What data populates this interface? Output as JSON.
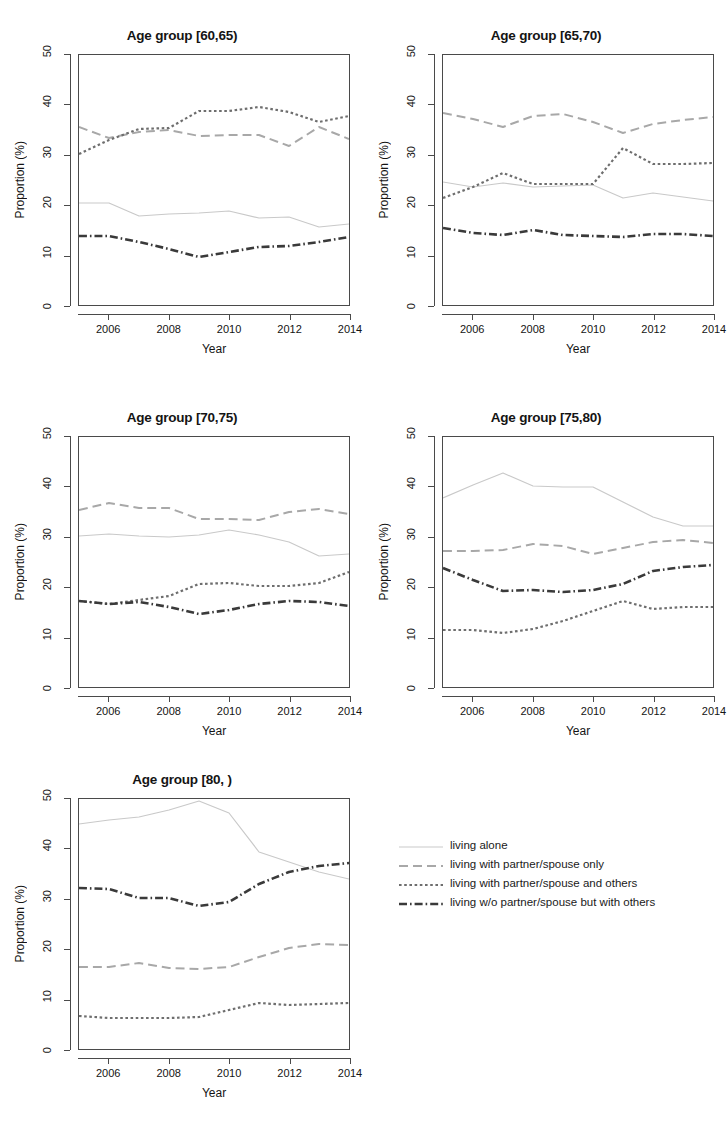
{
  "figure": {
    "axis_titles": {
      "x": "Year",
      "y": "Proportion (%)"
    },
    "y_ticks": [
      "0",
      "10",
      "20",
      "30",
      "40",
      "50"
    ],
    "x_ticks": [
      "2006",
      "2008",
      "2010",
      "2012",
      "2014"
    ]
  },
  "legend": {
    "entries": [
      {
        "label": "living alone",
        "style": "solid",
        "color": "#c9c9c9"
      },
      {
        "label": "living with partner/spouse only",
        "style": "longdash",
        "color": "#a8a8a8"
      },
      {
        "label": "living with partner/spouse and others",
        "style": "dotted",
        "color": "#6e6e6e"
      },
      {
        "label": "living w/o partner/spouse but with others",
        "style": "dashdot",
        "color": "#3a3a3a"
      }
    ]
  },
  "chart_data": [
    {
      "type": "line",
      "title": "Age group [60,65)",
      "xlabel": "Year",
      "ylabel": "Proportion (%)",
      "x": [
        2005,
        2006,
        2007,
        2008,
        2009,
        2010,
        2011,
        2012,
        2013,
        2014
      ],
      "xlim": [
        2005,
        2014
      ],
      "ylim": [
        0,
        50
      ],
      "grid": false,
      "series": [
        {
          "name": "living alone",
          "style": "solid",
          "color": "#c9c9c9",
          "values": [
            20.4,
            20.4,
            17.8,
            18.2,
            18.4,
            18.8,
            17.4,
            17.6,
            15.6,
            16.2
          ]
        },
        {
          "name": "living with partner/spouse only",
          "style": "longdash",
          "color": "#a8a8a8",
          "values": [
            35.6,
            33.4,
            34.6,
            35.0,
            33.8,
            34.0,
            34.0,
            31.8,
            35.6,
            33.2
          ]
        },
        {
          "name": "living with partner/spouse and others",
          "style": "dotted",
          "color": "#6e6e6e",
          "values": [
            30.2,
            33.0,
            35.2,
            35.4,
            38.8,
            38.8,
            39.6,
            38.6,
            36.6,
            37.8
          ]
        },
        {
          "name": "living w/o partner/spouse but with others",
          "style": "dashdot",
          "color": "#3a3a3a",
          "values": [
            13.8,
            13.8,
            12.6,
            11.2,
            9.6,
            10.6,
            11.6,
            11.8,
            12.6,
            13.6
          ]
        }
      ]
    },
    {
      "type": "line",
      "title": "Age group [65,70)",
      "xlabel": "Year",
      "ylabel": "Proportion (%)",
      "x": [
        2005,
        2006,
        2007,
        2008,
        2009,
        2010,
        2011,
        2012,
        2013,
        2014
      ],
      "xlim": [
        2005,
        2014
      ],
      "ylim": [
        0,
        50
      ],
      "grid": false,
      "series": [
        {
          "name": "living alone",
          "style": "solid",
          "color": "#c9c9c9",
          "values": [
            24.6,
            23.6,
            24.4,
            23.6,
            23.8,
            24.0,
            21.4,
            22.4,
            21.6,
            20.8
          ]
        },
        {
          "name": "living with partner/spouse only",
          "style": "longdash",
          "color": "#a8a8a8",
          "values": [
            38.4,
            37.2,
            35.6,
            37.8,
            38.2,
            36.6,
            34.4,
            36.2,
            37.0,
            37.6
          ]
        },
        {
          "name": "living with partner/spouse and others",
          "style": "dotted",
          "color": "#6e6e6e",
          "values": [
            21.4,
            23.6,
            26.4,
            24.2,
            24.2,
            24.2,
            31.4,
            28.2,
            28.2,
            28.4
          ]
        },
        {
          "name": "living w/o partner/spouse but with others",
          "style": "dashdot",
          "color": "#3a3a3a",
          "values": [
            15.4,
            14.4,
            14.0,
            15.0,
            14.0,
            13.8,
            13.6,
            14.2,
            14.2,
            13.8
          ]
        }
      ]
    },
    {
      "type": "line",
      "title": "Age group [70,75)",
      "xlabel": "Year",
      "ylabel": "Proportion (%)",
      "x": [
        2005,
        2006,
        2007,
        2008,
        2009,
        2010,
        2011,
        2012,
        2013,
        2014
      ],
      "xlim": [
        2005,
        2014
      ],
      "ylim": [
        0,
        50
      ],
      "grid": false,
      "series": [
        {
          "name": "living alone",
          "style": "solid",
          "color": "#c9c9c9",
          "values": [
            30.2,
            30.6,
            30.2,
            30.0,
            30.4,
            31.4,
            30.4,
            29.0,
            26.2,
            26.6
          ]
        },
        {
          "name": "living with partner/spouse only",
          "style": "longdash",
          "color": "#a8a8a8",
          "values": [
            35.4,
            36.8,
            35.8,
            35.8,
            33.6,
            33.6,
            33.4,
            35.0,
            35.6,
            34.6
          ]
        },
        {
          "name": "living with partner/spouse and others",
          "style": "dotted",
          "color": "#6e6e6e",
          "values": [
            17.2,
            16.6,
            17.4,
            18.2,
            20.6,
            20.8,
            20.2,
            20.2,
            20.8,
            23.0
          ]
        },
        {
          "name": "living w/o partner/spouse but with others",
          "style": "dashdot",
          "color": "#3a3a3a",
          "values": [
            17.2,
            16.6,
            17.0,
            16.0,
            14.6,
            15.4,
            16.6,
            17.2,
            17.0,
            16.2
          ]
        }
      ]
    },
    {
      "type": "line",
      "title": "Age group [75,80)",
      "xlabel": "Year",
      "ylabel": "Proportion (%)",
      "x": [
        2005,
        2006,
        2007,
        2008,
        2009,
        2010,
        2011,
        2012,
        2013,
        2014
      ],
      "xlim": [
        2005,
        2014
      ],
      "ylim": [
        0,
        50
      ],
      "grid": false,
      "series": [
        {
          "name": "living alone",
          "style": "solid",
          "color": "#c9c9c9",
          "values": [
            37.8,
            40.4,
            42.8,
            40.2,
            40.0,
            40.0,
            37.0,
            34.0,
            32.2,
            32.2
          ]
        },
        {
          "name": "living with partner/spouse only",
          "style": "longdash",
          "color": "#a8a8a8",
          "values": [
            27.2,
            27.2,
            27.4,
            28.6,
            28.2,
            26.6,
            27.8,
            29.0,
            29.4,
            28.8
          ]
        },
        {
          "name": "living with partner/spouse and others",
          "style": "dotted",
          "color": "#6e6e6e",
          "values": [
            11.4,
            11.4,
            10.8,
            11.6,
            13.2,
            15.2,
            17.2,
            15.6,
            16.0,
            16.0
          ]
        },
        {
          "name": "living w/o partner/spouse but with others",
          "style": "dashdot",
          "color": "#3a3a3a",
          "values": [
            23.8,
            21.4,
            19.2,
            19.4,
            19.0,
            19.4,
            20.6,
            23.2,
            24.0,
            24.4
          ]
        }
      ]
    },
    {
      "type": "line",
      "title": "Age group [80, )",
      "xlabel": "Year",
      "ylabel": "Proportion (%)",
      "x": [
        2005,
        2006,
        2007,
        2008,
        2009,
        2010,
        2011,
        2012,
        2013,
        2014
      ],
      "xlim": [
        2005,
        2014
      ],
      "ylim": [
        0,
        50
      ],
      "grid": false,
      "series": [
        {
          "name": "living alone",
          "style": "solid",
          "color": "#c9c9c9",
          "values": [
            45.0,
            45.8,
            46.4,
            47.8,
            49.6,
            47.2,
            39.4,
            37.4,
            35.4,
            34.0
          ]
        },
        {
          "name": "living with partner/spouse only",
          "style": "longdash",
          "color": "#a8a8a8",
          "values": [
            16.4,
            16.4,
            17.2,
            16.2,
            16.0,
            16.4,
            18.4,
            20.2,
            21.0,
            20.8
          ]
        },
        {
          "name": "living with partner/spouse and others",
          "style": "dotted",
          "color": "#6e6e6e",
          "values": [
            6.6,
            6.2,
            6.2,
            6.2,
            6.4,
            7.8,
            9.2,
            8.8,
            9.0,
            9.2
          ]
        },
        {
          "name": "living w/o partner/spouse but with others",
          "style": "dashdot",
          "color": "#3a3a3a",
          "values": [
            32.2,
            32.0,
            30.2,
            30.2,
            28.6,
            29.4,
            33.0,
            35.4,
            36.6,
            37.2
          ]
        }
      ]
    }
  ],
  "panel_positions": [
    {
      "left": 0,
      "top": 18
    },
    {
      "left": 364,
      "top": 18
    },
    {
      "left": 0,
      "top": 400
    },
    {
      "left": 364,
      "top": 400
    },
    {
      "left": 0,
      "top": 762
    }
  ]
}
